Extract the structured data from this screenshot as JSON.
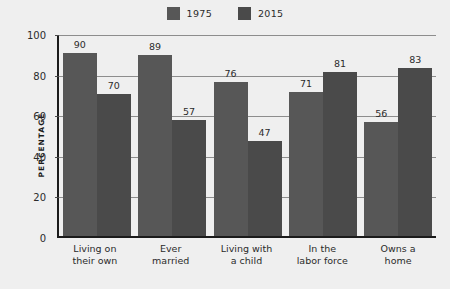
{
  "chart_data": {
    "type": "bar",
    "title": "",
    "xlabel": "",
    "ylabel": "PERCENTAGE",
    "ylim": [
      0,
      100
    ],
    "yticks": [
      0,
      20,
      40,
      60,
      80,
      100
    ],
    "grid": true,
    "legend_position": "top-center",
    "categories": [
      "Living on\ntheir own",
      "Ever\nmarried",
      "Living with\na child",
      "In the\nlabor force",
      "Owns a\nhome"
    ],
    "categories_lines": [
      [
        "Living on",
        "their own"
      ],
      [
        "Ever",
        "married"
      ],
      [
        "Living with",
        "a child"
      ],
      [
        "In the",
        "labor force"
      ],
      [
        "Owns a",
        "home"
      ]
    ],
    "series": [
      {
        "name": "1975",
        "color": "#575757",
        "values": [
          90,
          89,
          76,
          71,
          56
        ]
      },
      {
        "name": "2015",
        "color": "#4a4a4a",
        "values": [
          70,
          57,
          47,
          81,
          83
        ]
      }
    ]
  },
  "legend": {
    "items": [
      {
        "label": "1975",
        "color": "#575757"
      },
      {
        "label": "2015",
        "color": "#4a4a4a"
      }
    ]
  },
  "axis": {
    "y_title": "PERCENTAGE",
    "y_tick_labels": [
      "100",
      "80",
      "60",
      "40",
      "20",
      "0"
    ]
  },
  "colors": {
    "background": "#efefef",
    "plot_background": "#ededed",
    "axis_line": "#1b1b1b",
    "gridline": "#8d8d8d",
    "text": "#2b2b2b"
  }
}
